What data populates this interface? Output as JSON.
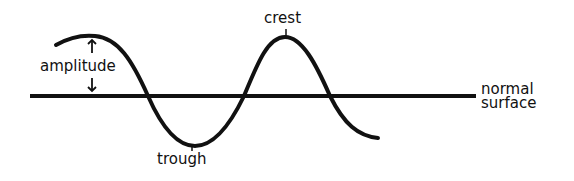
{
  "diagram": {
    "labels": {
      "crest": "crest",
      "trough": "trough",
      "amplitude": "amplitude",
      "normal_surface_line1": "normal",
      "normal_surface_line2": "surface"
    },
    "colors": {
      "stroke": "#111111",
      "background": "#ffffff"
    }
  }
}
